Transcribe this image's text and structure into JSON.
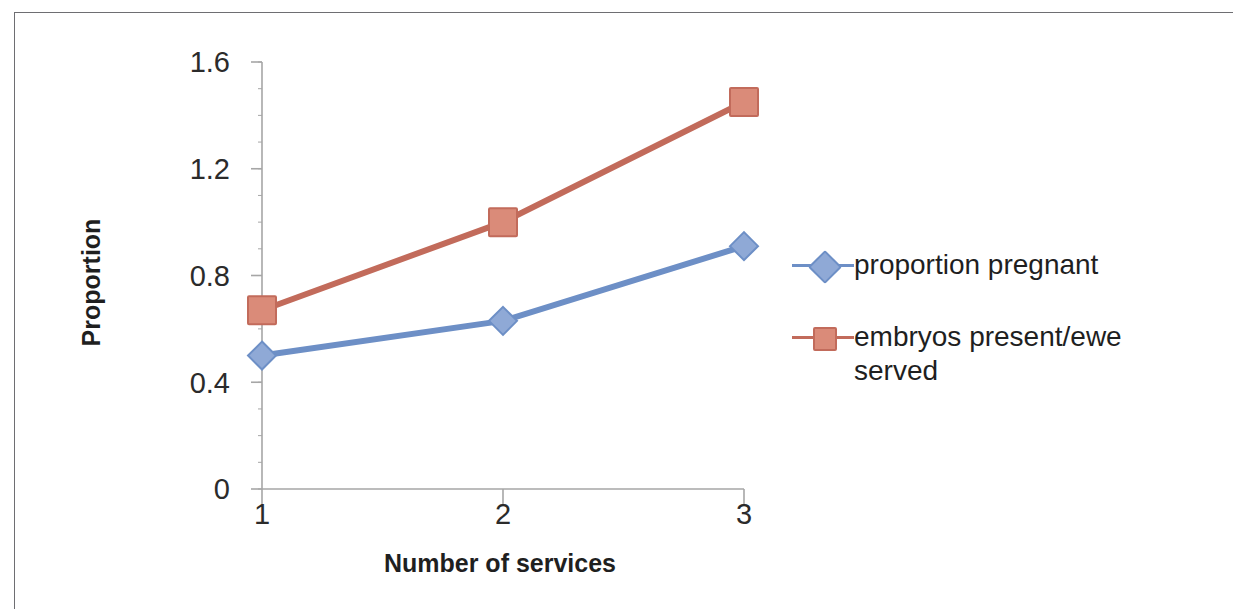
{
  "chart_data": {
    "type": "line",
    "title": "",
    "xlabel": "Number of services",
    "ylabel": "Proportion",
    "categories": [
      "1",
      "2",
      "3"
    ],
    "ytick_labels": [
      "0",
      "0.4",
      "0.8",
      "1.2",
      "1.6"
    ],
    "ytick_values": [
      0,
      0.4,
      0.8,
      1.2,
      1.6
    ],
    "ylim": [
      0,
      1.6
    ],
    "grid": false,
    "legend_position": "right",
    "series": [
      {
        "name": "proportion pregnant",
        "values": [
          0.5,
          0.63,
          0.91
        ],
        "color": "#6D8FC6",
        "marker": "diamond"
      },
      {
        "name": "embryos present/ewe served",
        "values": [
          0.67,
          1.0,
          1.45
        ],
        "color": "#C26B5B",
        "marker": "square"
      }
    ]
  },
  "axes": {
    "y_title": "Proportion",
    "x_title": "Number of services"
  },
  "legend": {
    "items": [
      {
        "label": "proportion pregnant",
        "color": "#6D8FC6",
        "marker": "diamond"
      },
      {
        "label": "embryos present/ewe served",
        "color": "#C26B5B",
        "marker": "square"
      }
    ]
  },
  "colors": {
    "series_blue": "#6D8FC6",
    "series_red": "#C26B5B",
    "axis": "#a6a6a6",
    "text": "#1f1f1f",
    "frame": "#6e6e72"
  }
}
